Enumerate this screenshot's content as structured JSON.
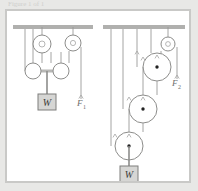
{
  "caption": {
    "text": "Figure 1 of 1"
  },
  "figure": {
    "background": "#ffffff",
    "frame_color": "#c9c9c7",
    "page_background": "#e8e8e6"
  },
  "colors": {
    "ceiling": "#b0b0ae",
    "rope": "#9a9a98",
    "pulley_stroke": "#8d8d8b",
    "pulley_fill": "#ffffff",
    "block_fill": "#d6d6d4",
    "block_stroke": "#7e7e7c",
    "label": "#6e6e6c",
    "center_dot": "#222222",
    "arrow": "#a6a6a4"
  },
  "panels": [
    {
      "id": "panel-left",
      "name": "first-pulley-system",
      "ceiling": {
        "x": 6,
        "y": 14,
        "width": 80,
        "height": 4
      },
      "fixed_pulleys": [
        {
          "name": "fixed-pulley-a",
          "cx": 35,
          "cy": 33,
          "r": 9,
          "stem_top": 16,
          "has_center_dot": false
        },
        {
          "name": "fixed-pulley-b",
          "cx": 66,
          "cy": 32,
          "r": 8,
          "stem_top": 16,
          "has_center_dot": false
        }
      ],
      "movable_pulleys": [
        {
          "name": "movable-pulley-left",
          "cx": 26,
          "cy": 60,
          "r": 8,
          "has_center_dot": false
        },
        {
          "name": "movable-pulley-right",
          "cx": 54,
          "cy": 60,
          "r": 8,
          "has_center_dot": false
        }
      ],
      "yoke_bar": {
        "x1": 26,
        "y1": 60,
        "x2": 54,
        "y2": 60,
        "thickness": 3
      },
      "load_block": {
        "name": "load-block-w",
        "label": "W",
        "x": 31,
        "y": 83,
        "width": 18,
        "height": 16,
        "hanger_from_y": 60,
        "hanger_x": 40
      },
      "force_label": {
        "name": "force-label-f1",
        "text": "F",
        "subscript": "1",
        "x": 70,
        "y": 92
      },
      "free_rope_end": {
        "x": 74,
        "y_top": 36,
        "y_bottom": 88
      }
    },
    {
      "id": "panel-right",
      "name": "second-pulley-system",
      "ceiling": {
        "x": 4,
        "y": 14,
        "width": 82,
        "height": 4
      },
      "fixed_pulleys": [
        {
          "name": "fixed-pulley-top",
          "cx": 69,
          "cy": 33,
          "r": 7,
          "stem_top": 16,
          "has_center_dot": false
        }
      ],
      "movable_pulleys": [
        {
          "name": "movable-pulley-upper",
          "cx": 58,
          "cy": 56,
          "r": 14,
          "has_center_dot": true
        },
        {
          "name": "movable-pulley-middle",
          "cx": 44,
          "cy": 98,
          "r": 14,
          "has_center_dot": true
        },
        {
          "name": "movable-pulley-lower",
          "cx": 30,
          "cy": 135,
          "r": 14,
          "has_center_dot": true
        }
      ],
      "load_block": {
        "name": "load-block-w",
        "label": "W",
        "x": 21,
        "y": 155,
        "width": 18,
        "height": 16,
        "hanger_from_y": 149,
        "hanger_x": 30
      },
      "force_label": {
        "name": "force-label-f2",
        "text": "F",
        "subscript": "2",
        "x": 73,
        "y": 72
      },
      "free_rope_end": {
        "x": 78,
        "y_top": 36,
        "y_bottom": 68
      }
    }
  ]
}
